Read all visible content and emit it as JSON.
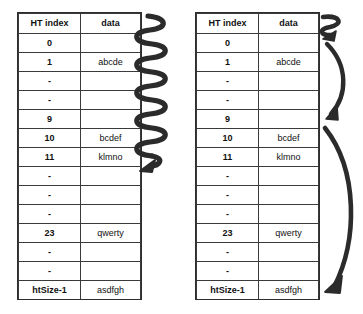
{
  "diagram": {
    "background_color": "#ffffff",
    "line_color": "#2e2e2e",
    "text_color": "#111111"
  },
  "columns": {
    "index_header": "HT index",
    "data_header": "data"
  },
  "left_table": {
    "caption": "hash table with sequential (coil) scan",
    "rows": [
      {
        "index": "0",
        "data": ""
      },
      {
        "index": "1",
        "data": "abcde"
      },
      {
        "index": "-",
        "data": ""
      },
      {
        "index": "-",
        "data": ""
      },
      {
        "index": "9",
        "data": ""
      },
      {
        "index": "10",
        "data": "bcdef"
      },
      {
        "index": "11",
        "data": "klmno"
      },
      {
        "index": "-",
        "data": ""
      },
      {
        "index": "-",
        "data": ""
      },
      {
        "index": "-",
        "data": ""
      },
      {
        "index": "23",
        "data": "qwerty"
      },
      {
        "index": "-",
        "data": ""
      },
      {
        "index": "-",
        "data": ""
      },
      {
        "index": "htSize-1",
        "data": "asdfgh"
      }
    ]
  },
  "right_table": {
    "caption": "hash table with jump (arc) scan",
    "rows": [
      {
        "index": "0",
        "data": ""
      },
      {
        "index": "1",
        "data": "abcde"
      },
      {
        "index": "-",
        "data": ""
      },
      {
        "index": "-",
        "data": ""
      },
      {
        "index": "9",
        "data": ""
      },
      {
        "index": "10",
        "data": "bcdef"
      },
      {
        "index": "11",
        "data": "klmno"
      },
      {
        "index": "-",
        "data": ""
      },
      {
        "index": "-",
        "data": ""
      },
      {
        "index": "-",
        "data": ""
      },
      {
        "index": "23",
        "data": "qwerty"
      },
      {
        "index": "-",
        "data": ""
      },
      {
        "index": "-",
        "data": ""
      },
      {
        "index": "htSize-1",
        "data": "asdfgh"
      }
    ]
  },
  "annotations": {
    "left_arrow": {
      "name": "coil-arrow",
      "shape": "vertical-zigzag-coil",
      "description": "thick coiled spring arrow running the full height of the left table, arrowhead pointing down"
    },
    "right_arrows": [
      {
        "name": "small-zigzag-arrow",
        "shape": "short-zigzag",
        "description": "small zigzag arrow beside the header / row 0"
      },
      {
        "name": "upper-arc-arrow",
        "shape": "curved-arc",
        "description": "arc curving from row 1 down to row 9, arrowhead at bottom"
      },
      {
        "name": "lower-arc-arrow",
        "shape": "curved-arc-long",
        "description": "long arc from row 10 down to the htSize-1 row, arrowhead at bottom"
      }
    ]
  }
}
